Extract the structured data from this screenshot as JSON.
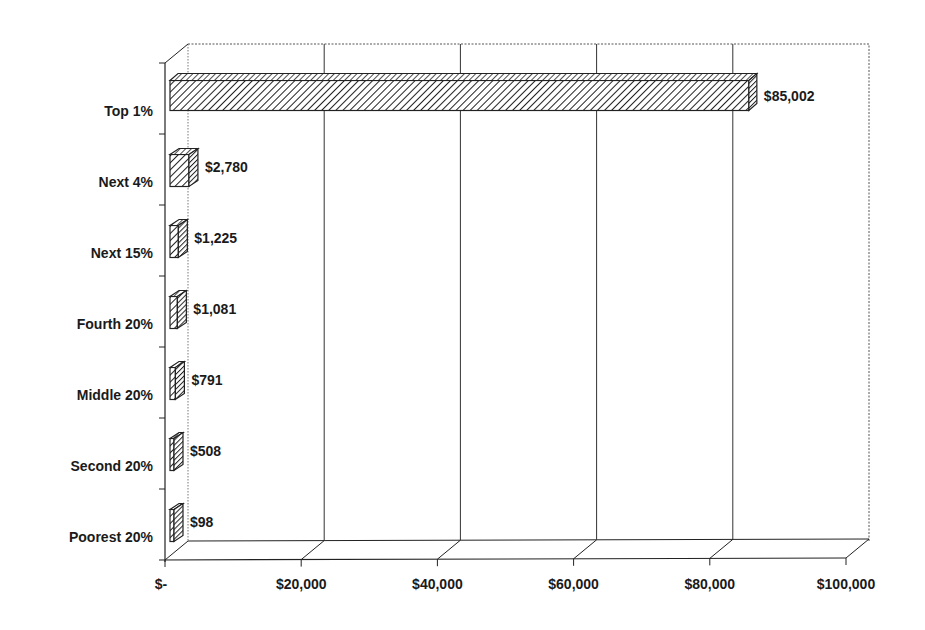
{
  "chart_data": {
    "type": "bar",
    "orientation": "horizontal",
    "style": "3d-clustered-bar",
    "title": "",
    "xlabel": "",
    "ylabel": "",
    "categories": [
      "Top 1%",
      "Next 4%",
      "Next 15%",
      "Fourth 20%",
      "Middle 20%",
      "Second 20%",
      "Poorest 20%"
    ],
    "values": [
      85002,
      2780,
      1225,
      1081,
      791,
      508,
      98
    ],
    "value_labels": [
      "$85,002",
      "$2,780",
      "$1,225",
      "$1,081",
      "$791",
      "$508",
      "$98"
    ],
    "xlim": [
      0,
      100000
    ],
    "xticks": [
      0,
      20000,
      40000,
      60000,
      80000,
      100000
    ],
    "xtick_labels": [
      "$-",
      "$20,000",
      "$40,000",
      "$60,000",
      "$80,000",
      "$100,000"
    ],
    "grid": true,
    "legend": "none",
    "colors": {
      "bar_fill": "#ffffff",
      "bar_hatch": "#222222",
      "axis": "#222222",
      "gridline": "#333333",
      "background": "#ffffff"
    }
  }
}
